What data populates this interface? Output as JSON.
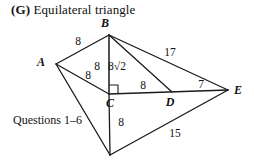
{
  "title": {
    "tag": "(G)",
    "text": "Equilateral triangle"
  },
  "caption": {
    "text": "Questions 1–6"
  },
  "chart_data": {
    "type": "diagram",
    "title": "(G) Equilateral triangle",
    "subtitle": "Questions 1–6",
    "vertices": [
      {
        "id": "A",
        "label": "A",
        "x": 56,
        "y": 64,
        "label_x": 41,
        "label_y": 66
      },
      {
        "id": "B",
        "label": "B",
        "x": 109,
        "y": 35,
        "label_x": 105,
        "label_y": 27
      },
      {
        "id": "C",
        "label": "C",
        "x": 109,
        "y": 94,
        "label_x": 110,
        "label_y": 107
      },
      {
        "id": "D",
        "label": "D",
        "x": 172,
        "y": 92,
        "label_x": 170,
        "label_y": 106
      },
      {
        "id": "E",
        "label": "E",
        "x": 228,
        "y": 90,
        "label_x": 238,
        "label_y": 94
      },
      {
        "id": "F",
        "label": "",
        "x": 110,
        "y": 155,
        "label_x": 110,
        "label_y": 155
      }
    ],
    "edges": [
      {
        "from": "A",
        "to": "B",
        "width": 1.3
      },
      {
        "from": "B",
        "to": "C",
        "width": 1.5
      },
      {
        "from": "A",
        "to": "C",
        "width": 1.3
      },
      {
        "from": "B",
        "to": "D",
        "width": 1.3
      },
      {
        "from": "B",
        "to": "E",
        "width": 1.3
      },
      {
        "from": "C",
        "to": "E",
        "width": 1.6
      },
      {
        "from": "A",
        "to": "F",
        "width": 1.3
      },
      {
        "from": "C",
        "to": "F",
        "width": 1.3
      },
      {
        "from": "F",
        "to": "E",
        "width": 1.3
      }
    ],
    "right_angle_at": "C",
    "measure_labels": [
      {
        "id": "ab",
        "text": "8",
        "x": 78,
        "y": 45,
        "edge": "A-B"
      },
      {
        "id": "bc",
        "text": "8",
        "x": 97,
        "y": 70,
        "edge": "B-C"
      },
      {
        "id": "ac",
        "text": "8",
        "x": 88,
        "y": 79,
        "edge": "A-C"
      },
      {
        "id": "bd",
        "text": "8√2",
        "x": 117,
        "y": 70,
        "edge": "B-D"
      },
      {
        "id": "be",
        "text": "17",
        "x": 170,
        "y": 56,
        "edge": "B-E"
      },
      {
        "id": "cd",
        "text": "8",
        "x": 143,
        "y": 89,
        "edge": "C-D"
      },
      {
        "id": "de",
        "text": "7",
        "x": 201,
        "y": 88,
        "edge": "D-E"
      },
      {
        "id": "cf",
        "text": "8",
        "x": 121,
        "y": 126,
        "edge": "C-F"
      },
      {
        "id": "fe",
        "text": "15",
        "x": 175,
        "y": 137,
        "edge": "F-E"
      }
    ]
  }
}
